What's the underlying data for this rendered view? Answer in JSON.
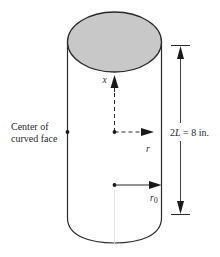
{
  "figure": {
    "labels": {
      "center_line1": "Center of",
      "center_line2": "curved face",
      "dimension": "2L = 8 in.",
      "dimension_parts": {
        "coef": "2",
        "var": "L",
        "rest": " = 8 in."
      },
      "axis_x": "x",
      "axis_r": "r",
      "radius_base": "r",
      "radius_sub": "0"
    },
    "colors": {
      "stroke": "#2a2a2a",
      "top_face_fill": "#c8c8c8",
      "background": "#ffffff"
    },
    "geometry": {
      "cylinder_height_label": "2L",
      "cylinder_height_value": "8 in."
    }
  }
}
